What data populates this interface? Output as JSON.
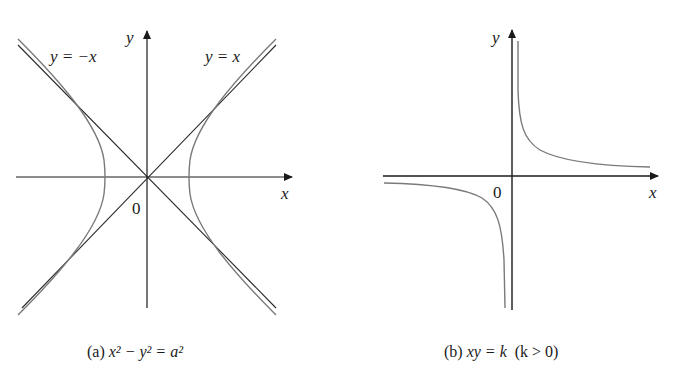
{
  "figure": {
    "panel_a": {
      "caption_prefix": "(a)",
      "caption_equation": "x² − y² = a²",
      "x_axis_label": "x",
      "y_axis_label": "y",
      "origin_label": "0",
      "asymptote_labels": [
        "y = −x",
        "y = x"
      ]
    },
    "panel_b": {
      "caption_prefix": "(b)",
      "caption_equation": "xy = k",
      "caption_condition": "(k > 0)",
      "x_axis_label": "x",
      "y_axis_label": "y",
      "origin_label": "0"
    }
  },
  "colors": {
    "axis": "#1a1a1a",
    "curve": "#7a7a7a",
    "background": "#ffffff"
  }
}
